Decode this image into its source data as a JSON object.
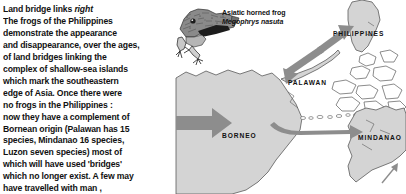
{
  "article": {
    "heading_prefix": "Land bridge links",
    "heading_suffix": "right",
    "body_lines": [
      "The frogs of the Philippines",
      "demonstrate the appearance",
      "and disappearance, over the ages,",
      "of land bridges linking the",
      "complex of shallow-sea islands",
      "which mark the southeastern",
      "edge of Asia. Once there were",
      "no frogs in the Philippines :",
      "now they have a complement of",
      "Bornean origin (Palawan has 15",
      "species, Mindanao 16 species,",
      "Luzon seven species) most of",
      "which will have used 'bridges'",
      "which no longer exist. A few may",
      "have travelled with man ,",
      "hitching a lift on his boats"
    ]
  },
  "figure": {
    "caption_common_name": "Asiatic horned frog",
    "caption_scientific_name": "Megophrys nasuta",
    "illustration_name": "asiatic-horned-frog-engraving"
  },
  "map": {
    "labels": {
      "philippines": "PHILIPPINES",
      "palawan": "PALAWAN",
      "borneo": "BORNEO",
      "mindanao": "MINDANAO"
    },
    "colors": {
      "land_fill": "#d4d4d4",
      "land_stroke": "#5a5a5a",
      "island_outline_fill": "#ffffff",
      "arrow_fill": "#8d8d8d",
      "sea": "#ffffff",
      "text": "#111111"
    },
    "migration_arrows": [
      {
        "name": "borneo-inbound-arrow",
        "from": "Asia",
        "to": "Borneo",
        "direction": "east"
      },
      {
        "name": "borneo-to-palawan-to-philippines-arrow",
        "from": "Borneo",
        "to": "Philippines",
        "direction": "northeast",
        "via": "Palawan"
      },
      {
        "name": "borneo-to-mindanao-arrow",
        "from": "Borneo",
        "to": "Mindanao",
        "direction": "east"
      },
      {
        "name": "outbound-northeast-arrow",
        "from": "Mindanao",
        "to": "Pacific",
        "direction": "northeast"
      }
    ]
  }
}
